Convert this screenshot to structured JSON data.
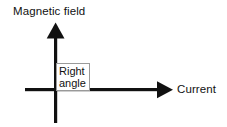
{
  "diagram": {
    "title_text": "",
    "background_color": "#ffffff",
    "stroke_color": "#111111",
    "vertical_axis": {
      "label": "Magnetic field",
      "icon": "up-arrow-icon",
      "direction": "up"
    },
    "horizontal_axis": {
      "label": "Current",
      "icon": "right-arrow-icon",
      "direction": "right"
    },
    "annotation": {
      "line1": "Right",
      "line2": "angle",
      "border_color": "#9a9a9a",
      "fill_color": "#ffffff"
    }
  }
}
